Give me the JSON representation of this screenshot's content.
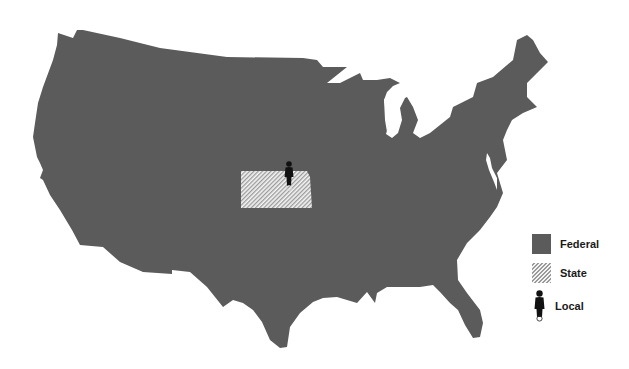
{
  "map": {
    "subject": "United States (contiguous)",
    "highlighted_state": "Kansas",
    "colors": {
      "federal": "#5b5b5b",
      "state_hatch_light": "#f4f4f4",
      "state_hatch_dark": "#9a9a9a",
      "local_figure": "#111111",
      "background": "#ffffff"
    }
  },
  "legend": {
    "items": [
      {
        "label": "Federal",
        "icon": "solid-gray-swatch"
      },
      {
        "label": "State",
        "icon": "hatched-swatch"
      },
      {
        "label": "Local",
        "icon": "person-figure-icon"
      }
    ]
  }
}
